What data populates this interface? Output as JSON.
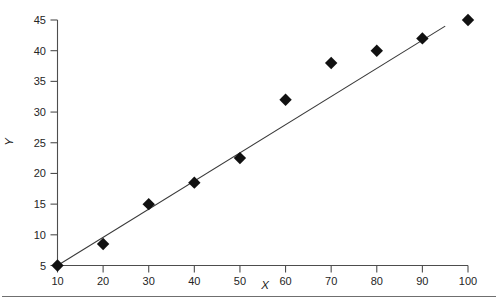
{
  "chart_data": {
    "type": "scatter",
    "title": "",
    "xlabel": "X",
    "ylabel": "Y",
    "xlim": [
      10,
      100
    ],
    "ylim": [
      5,
      45
    ],
    "grid": false,
    "legend": null,
    "x_ticks": [
      10,
      20,
      30,
      40,
      50,
      60,
      70,
      80,
      90,
      100
    ],
    "y_ticks": [
      5,
      10,
      15,
      20,
      25,
      30,
      35,
      40,
      45
    ],
    "x_tick_labels": [
      "10",
      "20",
      "30",
      "40",
      "50",
      "60",
      "70",
      "80",
      "90",
      "100"
    ],
    "y_tick_labels": [
      "5",
      "10",
      "15",
      "20",
      "25",
      "30",
      "35",
      "40",
      "45"
    ],
    "marker": "diamond",
    "marker_color": "#111111",
    "line_color": "#3a3a3a",
    "series": [
      {
        "name": "data",
        "x": [
          10,
          20,
          30,
          40,
          50,
          60,
          70,
          80,
          90,
          100
        ],
        "values": [
          5,
          8.5,
          15,
          18.5,
          22.5,
          32,
          38,
          40,
          42,
          45
        ]
      }
    ],
    "trend_line": {
      "name": "fit-line",
      "x": [
        10,
        95
      ],
      "y": [
        5,
        44
      ]
    }
  },
  "figure": {
    "background_color": "#ffffff",
    "axis_color": "#4d4d4d",
    "footer_rule_color": "#6f6f6f"
  }
}
